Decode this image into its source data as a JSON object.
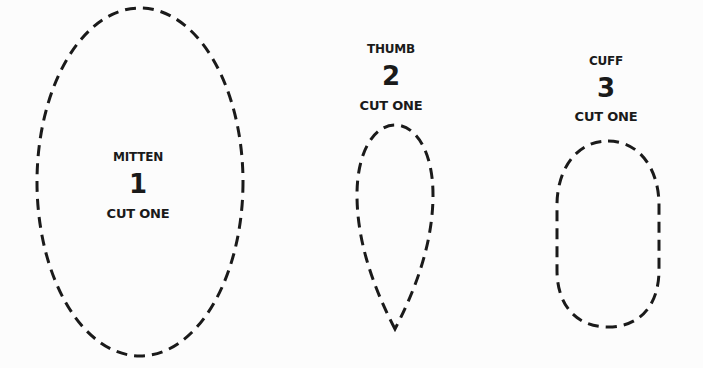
{
  "pattern": {
    "stroke_color": "#1a1a1a",
    "background_color": "#fcfcfc",
    "pieces": [
      {
        "name": "MITTEN",
        "number": "1",
        "instruction": "CUT ONE",
        "shape": "ellipse"
      },
      {
        "name": "THUMB",
        "number": "2",
        "instruction": "CUT ONE",
        "shape": "teardrop"
      },
      {
        "name": "CUFF",
        "number": "3",
        "instruction": "CUT ONE",
        "shape": "rounded-oval"
      }
    ]
  }
}
